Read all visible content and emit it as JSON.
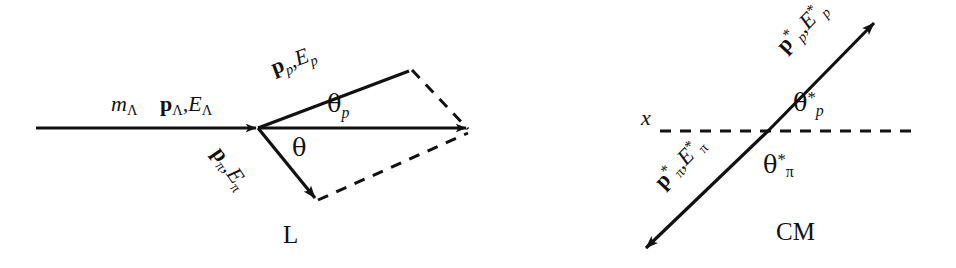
{
  "figure": {
    "width": 956,
    "height": 268,
    "background": "#ffffff",
    "stroke_color": "#111111"
  },
  "lab_panel": {
    "frame_label": "L",
    "incoming": {
      "mass_label_base": "m",
      "mass_label_sub": "Λ",
      "momentum_bold": "p",
      "momentum_sub": "Λ",
      "comma": ",",
      "energy_base": "E",
      "energy_sub": "Λ"
    },
    "proton": {
      "momentum_bold": "p",
      "momentum_sub": "p",
      "comma": ",",
      "energy_base": "E",
      "energy_sub": "p"
    },
    "pion": {
      "momentum_bold": "p",
      "momentum_sub": "π",
      "comma": ",",
      "energy_base": "E",
      "energy_sub": "π"
    },
    "angles": {
      "theta_p_base": "θ",
      "theta_p_sub": "p",
      "theta_base": "θ"
    }
  },
  "cm_panel": {
    "frame_label": "CM",
    "axis_label": "x",
    "proton": {
      "momentum_bold": "p",
      "momentum_star": "*",
      "momentum_sub": "p",
      "comma": ",",
      "energy_base": "E",
      "energy_star": "*",
      "energy_sub": "p"
    },
    "pion": {
      "momentum_bold": "p",
      "momentum_star": "*",
      "momentum_sub": "π",
      "comma": ",",
      "energy_base": "E",
      "energy_star": "*",
      "energy_sub": "π"
    },
    "angles": {
      "theta_p_base": "θ",
      "theta_p_star": "*",
      "theta_p_sub": "p",
      "theta_pi_base": "θ",
      "theta_pi_star": "*",
      "theta_pi_sub": "π"
    }
  }
}
